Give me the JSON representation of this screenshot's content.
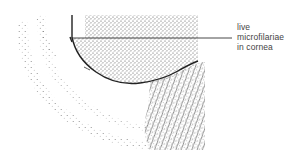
{
  "figure": {
    "label": {
      "lines": [
        "live",
        "microfilariae",
        "in cornea"
      ]
    },
    "colors": {
      "ink": "#222222",
      "stipple": "#555555",
      "background": "#ffffff"
    }
  }
}
